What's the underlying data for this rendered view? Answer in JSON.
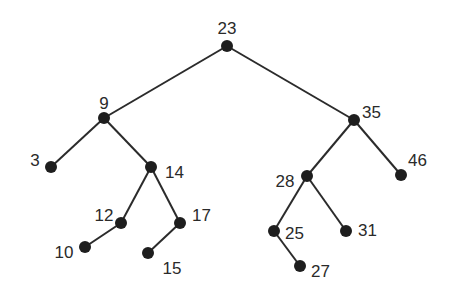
{
  "diagram": {
    "type": "binary-search-tree",
    "colors": {
      "edge": "#2b2b2b",
      "node": "#1e1e1e",
      "label": "#2a2a2a",
      "background": "#ffffff"
    },
    "nodes": [
      {
        "id": "23",
        "label": "23",
        "x": 227,
        "y": 46,
        "lx": 227,
        "ly": 30,
        "anchor": "middle"
      },
      {
        "id": "9",
        "label": "9",
        "x": 104,
        "y": 118,
        "lx": 104,
        "ly": 105,
        "anchor": "middle"
      },
      {
        "id": "35",
        "label": "35",
        "x": 354,
        "y": 120,
        "lx": 362,
        "ly": 114,
        "anchor": "start"
      },
      {
        "id": "3",
        "label": "3",
        "x": 51,
        "y": 167,
        "lx": 35,
        "ly": 162,
        "anchor": "middle"
      },
      {
        "id": "14",
        "label": "14",
        "x": 151,
        "y": 167,
        "lx": 165,
        "ly": 174,
        "anchor": "start"
      },
      {
        "id": "12",
        "label": "12",
        "x": 121,
        "y": 223,
        "lx": 104,
        "ly": 217,
        "anchor": "middle"
      },
      {
        "id": "17",
        "label": "17",
        "x": 180,
        "y": 223,
        "lx": 192,
        "ly": 217,
        "anchor": "start"
      },
      {
        "id": "10",
        "label": "10",
        "x": 85,
        "y": 247,
        "lx": 64,
        "ly": 254,
        "anchor": "middle"
      },
      {
        "id": "15",
        "label": "15",
        "x": 148,
        "y": 253,
        "lx": 172,
        "ly": 270,
        "anchor": "middle"
      },
      {
        "id": "28",
        "label": "28",
        "x": 307,
        "y": 176,
        "lx": 285,
        "ly": 183,
        "anchor": "middle"
      },
      {
        "id": "46",
        "label": "46",
        "x": 401,
        "y": 175,
        "lx": 408,
        "ly": 162,
        "anchor": "start"
      },
      {
        "id": "25",
        "label": "25",
        "x": 274,
        "y": 231,
        "lx": 285,
        "ly": 235,
        "anchor": "start"
      },
      {
        "id": "31",
        "label": "31",
        "x": 346,
        "y": 231,
        "lx": 358,
        "ly": 232,
        "anchor": "start"
      },
      {
        "id": "27",
        "label": "27",
        "x": 300,
        "y": 266,
        "lx": 311,
        "ly": 273,
        "anchor": "start"
      }
    ],
    "edges": [
      {
        "from": "23",
        "to": "9"
      },
      {
        "from": "23",
        "to": "35"
      },
      {
        "from": "9",
        "to": "3"
      },
      {
        "from": "9",
        "to": "14"
      },
      {
        "from": "14",
        "to": "12"
      },
      {
        "from": "14",
        "to": "17"
      },
      {
        "from": "12",
        "to": "10"
      },
      {
        "from": "17",
        "to": "15"
      },
      {
        "from": "35",
        "to": "28"
      },
      {
        "from": "35",
        "to": "46"
      },
      {
        "from": "28",
        "to": "25"
      },
      {
        "from": "28",
        "to": "31"
      },
      {
        "from": "25",
        "to": "27"
      }
    ]
  }
}
